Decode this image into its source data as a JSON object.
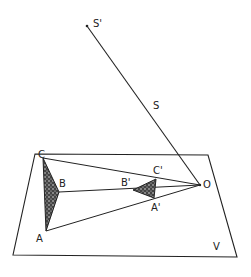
{
  "diagram": {
    "type": "projection-geometry",
    "plane_label": "V",
    "ray_label": "S",
    "points": {
      "S_prime": "S'",
      "O": "O",
      "A": "A",
      "B": "B",
      "C": "C",
      "A_prime": "A'",
      "B_prime": "B'",
      "C_prime": "C'"
    },
    "colors": {
      "stroke": "#222222",
      "fill": "#333333",
      "background": "#ffffff"
    }
  }
}
